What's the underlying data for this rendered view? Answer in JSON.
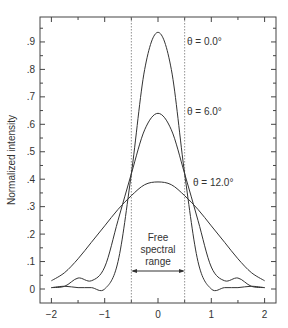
{
  "chart_data": {
    "type": "line",
    "title": "",
    "xlabel": "",
    "ylabel": "Normalized intensity",
    "xlim": [
      -2.2,
      2.2
    ],
    "ylim": [
      -0.04,
      1.0
    ],
    "x_ticks": [
      -2,
      -1,
      0,
      1,
      2
    ],
    "x_tick_labels": [
      "−2",
      "−1",
      "0",
      "1",
      "2"
    ],
    "y_ticks": [
      0,
      0.1,
      0.2,
      0.3,
      0.4,
      0.5,
      0.6,
      0.7,
      0.8,
      0.9
    ],
    "y_tick_labels": [
      "0",
      ".1",
      ".2",
      ".3",
      ".4",
      ".5",
      ".6",
      ".7",
      ".8",
      ".9"
    ],
    "grid": false,
    "legend": "inline labels on curves",
    "series": [
      {
        "name": "θ = 0.0°",
        "label": "θ = 0.0°",
        "x": [
          -2,
          -1.75,
          -1.5,
          -1.25,
          -1.0,
          -0.75,
          -0.5,
          -0.25,
          0,
          0.25,
          0.5,
          0.75,
          1.0,
          1.25,
          1.5,
          1.75,
          2
        ],
        "values": [
          0.005,
          0.01,
          0.005,
          0.005,
          0.0,
          0.1,
          0.42,
          0.8,
          0.935,
          0.8,
          0.42,
          0.1,
          0.0,
          0.005,
          0.005,
          0.01,
          0.005
        ]
      },
      {
        "name": "θ = 6.0°",
        "label": "θ = 6.0°",
        "x": [
          -2,
          -1.75,
          -1.5,
          -1.25,
          -1.0,
          -0.75,
          -0.5,
          -0.25,
          0,
          0.25,
          0.5,
          0.75,
          1.0,
          1.25,
          1.5,
          1.75,
          2
        ],
        "values": [
          0.005,
          0.01,
          0.04,
          0.03,
          0.08,
          0.25,
          0.42,
          0.58,
          0.64,
          0.58,
          0.42,
          0.25,
          0.08,
          0.03,
          0.04,
          0.01,
          0.005
        ]
      },
      {
        "name": "θ = 12.0°",
        "label": "θ = 12.0°",
        "x": [
          -2,
          -1.75,
          -1.5,
          -1.25,
          -1.0,
          -0.75,
          -0.5,
          -0.25,
          0,
          0.25,
          0.5,
          0.75,
          1.0,
          1.25,
          1.5,
          1.75,
          2
        ],
        "values": [
          0.03,
          0.06,
          0.11,
          0.17,
          0.23,
          0.29,
          0.34,
          0.38,
          0.39,
          0.38,
          0.34,
          0.29,
          0.23,
          0.17,
          0.11,
          0.06,
          0.03
        ]
      }
    ],
    "annotations": [
      {
        "text": "Free spectral range",
        "lines": [
          "Free",
          "spectral",
          "range"
        ],
        "x_range": [
          -0.5,
          0.5
        ],
        "y": 0.09,
        "type": "double-arrow"
      },
      {
        "type": "vline",
        "x": -0.5,
        "style": "dotted"
      },
      {
        "type": "vline",
        "x": 0.5,
        "style": "dotted"
      }
    ]
  },
  "labels": {
    "ylabel": "Normalized intensity",
    "curve0": "θ = 0.0°",
    "curve1": "θ = 6.0°",
    "curve2": "θ = 12.0°",
    "fsr_line1": "Free",
    "fsr_line2": "spectral",
    "fsr_line3": "range"
  }
}
